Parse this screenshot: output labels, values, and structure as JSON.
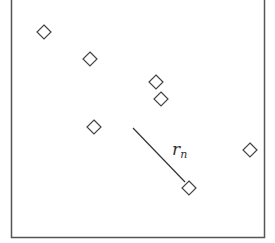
{
  "diagram": {
    "type": "point-scatter-with-radius",
    "frame": {
      "x1": 11.5,
      "y1": -2,
      "x2": 264.5,
      "y2": 237.5,
      "stroke": "#555555"
    },
    "marker": {
      "shape": "diamond",
      "half_size": 7,
      "stroke": "#444444",
      "fill": "#ffffff"
    },
    "points": [
      {
        "x": 44,
        "y": 32
      },
      {
        "x": 90,
        "y": 59
      },
      {
        "x": 156,
        "y": 82
      },
      {
        "x": 161,
        "y": 99
      },
      {
        "x": 94,
        "y": 127
      },
      {
        "x": 250,
        "y": 150
      },
      {
        "x": 189,
        "y": 188
      }
    ],
    "radius_line": {
      "x1": 133,
      "y1": 128,
      "x2": 185,
      "y2": 182,
      "stroke": "#333333"
    },
    "radius_label": {
      "main": "r",
      "sub": "n",
      "x": 172,
      "y": 155
    }
  }
}
